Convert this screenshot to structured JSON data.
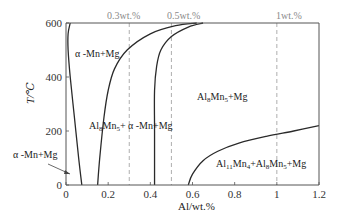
{
  "chart_data": {
    "type": "line",
    "title": "",
    "xlabel": "Al/wt.%",
    "ylabel": "T/℃",
    "xlim": [
      0,
      1.2
    ],
    "ylim": [
      0,
      600
    ],
    "xticks": [
      0,
      0.2,
      0.4,
      0.6,
      0.8,
      1,
      1.2
    ],
    "xtick_labels": [
      "0",
      "0.2",
      "0.4",
      "0.6",
      "0.8",
      "1",
      "1.2"
    ],
    "yticks": [
      0,
      200,
      400,
      600
    ],
    "ytick_labels": [
      "0",
      "200",
      "400",
      "600"
    ],
    "grid": false,
    "legend": null,
    "reference_lines": [
      {
        "x": 0.3,
        "label": "0.3wt.%",
        "style": "dashed",
        "color": "#9a9a9a"
      },
      {
        "x": 0.5,
        "label": "0.5wt.%",
        "style": "dashed",
        "color": "#9a9a9a"
      },
      {
        "x": 1.0,
        "label": "1wt.%",
        "style": "dashed",
        "color": "#9a9a9a"
      }
    ],
    "series": [
      {
        "name": "alpha-Mn+Mg solvus (left boundary)",
        "x": [
          0.02,
          0.01,
          0.01,
          0.02,
          0.04,
          0.06,
          0.075
        ],
        "y": [
          600,
          560,
          500,
          400,
          250,
          100,
          0
        ]
      },
      {
        "name": "alpha-Mn+Mg / Al8Mn5+alpha-Mn+Mg boundary",
        "x": [
          0.15,
          0.16,
          0.18,
          0.2,
          0.23,
          0.29,
          0.4,
          0.52,
          0.62
        ],
        "y": [
          0,
          100,
          250,
          350,
          430,
          500,
          560,
          590,
          600
        ]
      },
      {
        "name": "Al8Mn5+alpha-Mn+Mg / Al8Mn5+Mg boundary",
        "x": [
          0.42,
          0.42,
          0.42,
          0.43,
          0.45,
          0.5,
          0.58,
          0.65
        ],
        "y": [
          0,
          200,
          350,
          440,
          500,
          550,
          585,
          600
        ]
      },
      {
        "name": "Al8Mn5+Mg / Al11Mn4+Al8Mn5+Mg boundary",
        "x": [
          0.58,
          0.6,
          0.65,
          0.72,
          0.82,
          0.95,
          1.08,
          1.2
        ],
        "y": [
          0,
          40,
          90,
          125,
          155,
          180,
          200,
          220
        ]
      }
    ],
    "annotations": [
      {
        "text": "α -Mn+Mg",
        "x": 0.09,
        "y": 500,
        "region": "upper-left"
      },
      {
        "text": "Al8Mn5+ α -Mn+Mg",
        "x": 0.17,
        "y": 225,
        "region": "middle"
      },
      {
        "text": "Al8Mn5+Mg",
        "x": 0.62,
        "y": 350,
        "region": "upper-right"
      },
      {
        "text": "Al11Mn4+Al8Mn5+Mg",
        "x": 0.74,
        "y": 75,
        "region": "lower-right"
      },
      {
        "text": "α -Mn+Mg",
        "x": -0.23,
        "y": 140,
        "region": "left-outside",
        "arrow_to": [
          0.03,
          60
        ]
      }
    ]
  },
  "labels": {
    "ref_03": "0.3wt.%",
    "ref_05": "0.5wt.%",
    "ref_1": "1wt.%",
    "alpha_upper": "α -Mn+Mg",
    "alpha_lower": "α -Mn+Mg",
    "al8_base": "Al",
    "al8_sub": "8",
    "al8_mn": "Mn",
    "al8_mnsub": "5",
    "al8_rest": "+ α -Mn+Mg",
    "al8mg_rest": "+Mg",
    "al11_base": "Al",
    "al11_sub": "11",
    "al11_mn": "Mn",
    "al11_mnsub": "4",
    "al11_plus": "+Al",
    "al11_al8sub": "8",
    "al11_mn2": "Mn",
    "al11_mn2sub": "5",
    "al11_rest": "+Mg",
    "xlabel": "Al/wt.%",
    "ylabel": "T/℃"
  }
}
